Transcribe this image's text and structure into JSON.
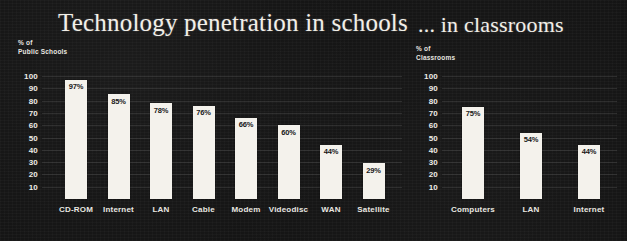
{
  "background_color": "#141414",
  "bar_color": "#f4f2ec",
  "text_color": "#efece6",
  "value_text_color": "#101010",
  "charts": {
    "left": {
      "title": "Technology penetration in schools",
      "axis_caption": "% of\nPublic Schools",
      "yticks": [
        "100",
        "90",
        "80",
        "70",
        "60",
        "50",
        "40",
        "30",
        "20",
        "10"
      ]
    },
    "right": {
      "title": "... in classrooms",
      "axis_caption": "% of\nClassrooms",
      "yticks": [
        "100",
        "90",
        "80",
        "70",
        "60",
        "50",
        "40",
        "30",
        "20",
        "10"
      ]
    }
  },
  "chart_data": [
    {
      "type": "bar",
      "title": "Technology penetration in schools",
      "xlabel": "",
      "ylabel": "% of Public Schools",
      "ylim": [
        0,
        100
      ],
      "grid": false,
      "legend": "none",
      "yticks": [
        100,
        90,
        80,
        70,
        60,
        50,
        40,
        30,
        20,
        10
      ],
      "categories": [
        "CD-ROM",
        "Internet",
        "LAN",
        "Cable",
        "Modem",
        "Videodisc",
        "WAN",
        "Satellite"
      ],
      "values": [
        97,
        85,
        78,
        76,
        66,
        60,
        44,
        29
      ],
      "value_labels": [
        "97%",
        "85%",
        "78%",
        "76%",
        "66%",
        "60%",
        "44%",
        "29%"
      ]
    },
    {
      "type": "bar",
      "title": "... in classrooms",
      "xlabel": "",
      "ylabel": "% of Classrooms",
      "ylim": [
        0,
        100
      ],
      "grid": false,
      "legend": "none",
      "yticks": [
        100,
        90,
        80,
        70,
        60,
        50,
        40,
        30,
        20,
        10
      ],
      "categories": [
        "Computers",
        "LAN",
        "Internet"
      ],
      "values": [
        75,
        54,
        44
      ],
      "value_labels": [
        "75%",
        "54%",
        "44%"
      ]
    }
  ]
}
